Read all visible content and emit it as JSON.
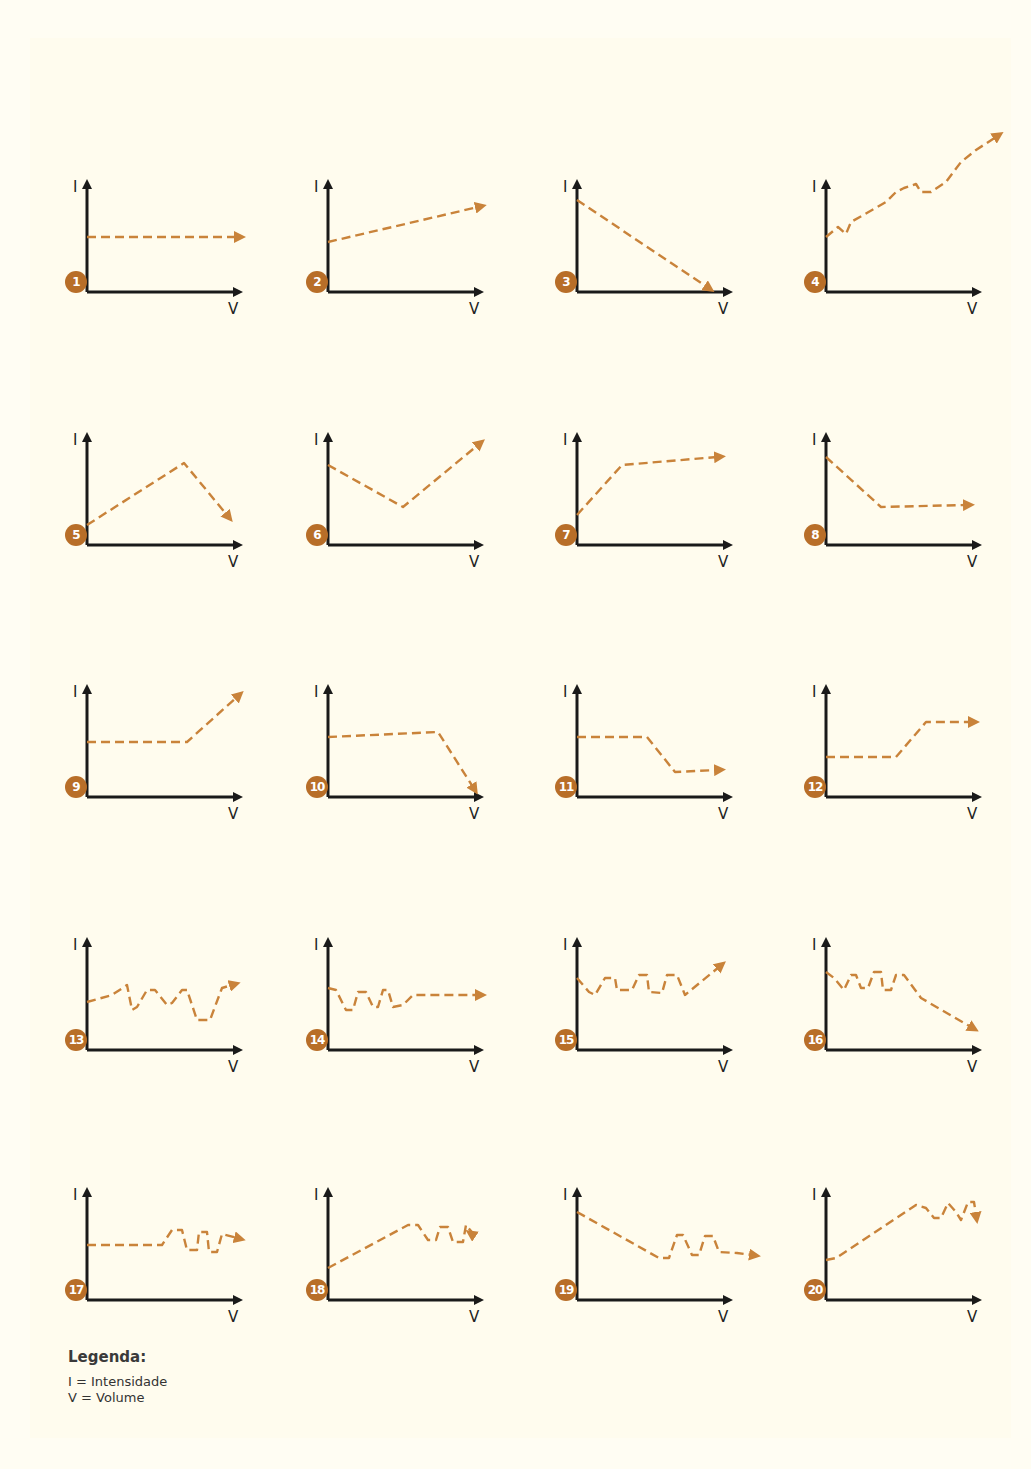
{
  "colors": {
    "accent": "#c9833a",
    "badge": "#b86e28",
    "axis": "#1a1a1a",
    "background": "#fffdf3"
  },
  "axes": {
    "y_label": "I",
    "x_label": "V"
  },
  "legend": {
    "title": "Legenda:",
    "items": [
      "I = Intensidade",
      "V = Volume"
    ]
  },
  "chart_data": {
    "type": "line",
    "title": "",
    "xlabel": "V",
    "ylabel": "I",
    "grid": false,
    "panels": [
      {
        "id": 1,
        "label": "1",
        "points": [
          [
            0,
            55
          ],
          [
            150,
            55
          ]
        ]
      },
      {
        "id": 2,
        "label": "2",
        "points": [
          [
            0,
            50
          ],
          [
            150,
            85
          ]
        ]
      },
      {
        "id": 3,
        "label": "3",
        "points": [
          [
            0,
            92
          ],
          [
            130,
            5
          ]
        ]
      },
      {
        "id": 4,
        "label": "4",
        "points": [
          [
            0,
            55
          ],
          [
            12,
            65
          ],
          [
            20,
            58
          ],
          [
            25,
            70
          ],
          [
            60,
            90
          ],
          [
            70,
            100
          ],
          [
            78,
            104
          ],
          [
            90,
            108
          ],
          [
            95,
            100
          ],
          [
            105,
            100
          ],
          [
            120,
            110
          ],
          [
            135,
            130
          ],
          [
            150,
            142
          ],
          [
            170,
            155
          ]
        ]
      },
      {
        "id": 5,
        "label": "5",
        "points": [
          [
            0,
            20
          ],
          [
            97,
            82
          ],
          [
            140,
            30
          ]
        ]
      },
      {
        "id": 6,
        "label": "6",
        "points": [
          [
            0,
            80
          ],
          [
            75,
            38
          ],
          [
            150,
            100
          ]
        ]
      },
      {
        "id": 7,
        "label": "7",
        "points": [
          [
            0,
            30
          ],
          [
            45,
            80
          ],
          [
            140,
            88
          ]
        ]
      },
      {
        "id": 8,
        "label": "8",
        "points": [
          [
            0,
            88
          ],
          [
            55,
            38
          ],
          [
            140,
            40
          ]
        ]
      },
      {
        "id": 9,
        "label": "9",
        "points": [
          [
            0,
            55
          ],
          [
            100,
            55
          ],
          [
            150,
            100
          ]
        ]
      },
      {
        "id": 10,
        "label": "10",
        "points": [
          [
            0,
            60
          ],
          [
            110,
            65
          ],
          [
            145,
            10
          ]
        ]
      },
      {
        "id": 11,
        "label": "11",
        "points": [
          [
            0,
            60
          ],
          [
            70,
            60
          ],
          [
            98,
            25
          ],
          [
            140,
            27
          ]
        ]
      },
      {
        "id": 12,
        "label": "12",
        "points": [
          [
            0,
            40
          ],
          [
            70,
            40
          ],
          [
            100,
            75
          ],
          [
            145,
            75
          ]
        ]
      },
      {
        "id": 13,
        "label": "13",
        "points": [
          [
            0,
            48
          ],
          [
            25,
            55
          ],
          [
            40,
            65
          ],
          [
            45,
            40
          ],
          [
            50,
            43
          ],
          [
            60,
            60
          ],
          [
            68,
            60
          ],
          [
            80,
            45
          ],
          [
            85,
            47
          ],
          [
            95,
            60
          ],
          [
            100,
            60
          ],
          [
            110,
            30
          ],
          [
            123,
            30
          ],
          [
            135,
            62
          ],
          [
            145,
            65
          ]
        ]
      },
      {
        "id": 14,
        "label": "14",
        "points": [
          [
            0,
            62
          ],
          [
            8,
            60
          ],
          [
            18,
            40
          ],
          [
            25,
            40
          ],
          [
            30,
            58
          ],
          [
            38,
            58
          ],
          [
            45,
            43
          ],
          [
            50,
            43
          ],
          [
            55,
            60
          ],
          [
            60,
            60
          ],
          [
            65,
            43
          ],
          [
            75,
            45
          ],
          [
            85,
            55
          ],
          [
            150,
            55
          ]
        ]
      },
      {
        "id": 15,
        "label": "15",
        "points": [
          [
            0,
            72
          ],
          [
            12,
            58
          ],
          [
            18,
            55
          ],
          [
            28,
            72
          ],
          [
            38,
            72
          ],
          [
            40,
            60
          ],
          [
            55,
            60
          ],
          [
            62,
            75
          ],
          [
            70,
            75
          ],
          [
            72,
            58
          ],
          [
            85,
            57
          ],
          [
            90,
            75
          ],
          [
            100,
            75
          ],
          [
            108,
            55
          ],
          [
            142,
            83
          ]
        ]
      },
      {
        "id": 16,
        "label": "16",
        "points": [
          [
            0,
            78
          ],
          [
            8,
            72
          ],
          [
            18,
            60
          ],
          [
            25,
            75
          ],
          [
            30,
            75
          ],
          [
            35,
            62
          ],
          [
            42,
            62
          ],
          [
            48,
            78
          ],
          [
            55,
            78
          ],
          [
            57,
            60
          ],
          [
            65,
            60
          ],
          [
            70,
            75
          ],
          [
            78,
            75
          ],
          [
            95,
            52
          ],
          [
            145,
            23
          ]
        ]
      },
      {
        "id": 17,
        "label": "17",
        "points": [
          [
            0,
            55
          ],
          [
            75,
            55
          ],
          [
            85,
            70
          ],
          [
            95,
            70
          ],
          [
            100,
            50
          ],
          [
            110,
            50
          ],
          [
            112,
            68
          ],
          [
            120,
            68
          ],
          [
            122,
            48
          ],
          [
            130,
            48
          ],
          [
            135,
            66
          ],
          [
            150,
            62
          ]
        ]
      },
      {
        "id": 18,
        "label": "18",
        "points": [
          [
            0,
            32
          ],
          [
            80,
            75
          ],
          [
            90,
            75
          ],
          [
            100,
            60
          ],
          [
            108,
            60
          ],
          [
            112,
            73
          ],
          [
            120,
            73
          ],
          [
            125,
            58
          ],
          [
            135,
            58
          ],
          [
            138,
            75
          ],
          [
            148,
            63
          ],
          [
            145,
            65
          ]
        ]
      },
      {
        "id": 19,
        "label": "19",
        "points": [
          [
            0,
            88
          ],
          [
            82,
            42
          ],
          [
            92,
            42
          ],
          [
            100,
            65
          ],
          [
            106,
            65
          ],
          [
            115,
            45
          ],
          [
            122,
            45
          ],
          [
            128,
            64
          ],
          [
            136,
            64
          ],
          [
            142,
            48
          ],
          [
            160,
            47
          ],
          [
            175,
            45
          ]
        ]
      },
      {
        "id": 20,
        "label": "20",
        "points": [
          [
            0,
            40
          ],
          [
            10,
            42
          ],
          [
            90,
            95
          ],
          [
            100,
            92
          ],
          [
            108,
            82
          ],
          [
            115,
            82
          ],
          [
            122,
            97
          ],
          [
            130,
            88
          ],
          [
            135,
            80
          ],
          [
            142,
            98
          ],
          [
            148,
            98
          ],
          [
            150,
            85
          ]
        ]
      }
    ]
  }
}
